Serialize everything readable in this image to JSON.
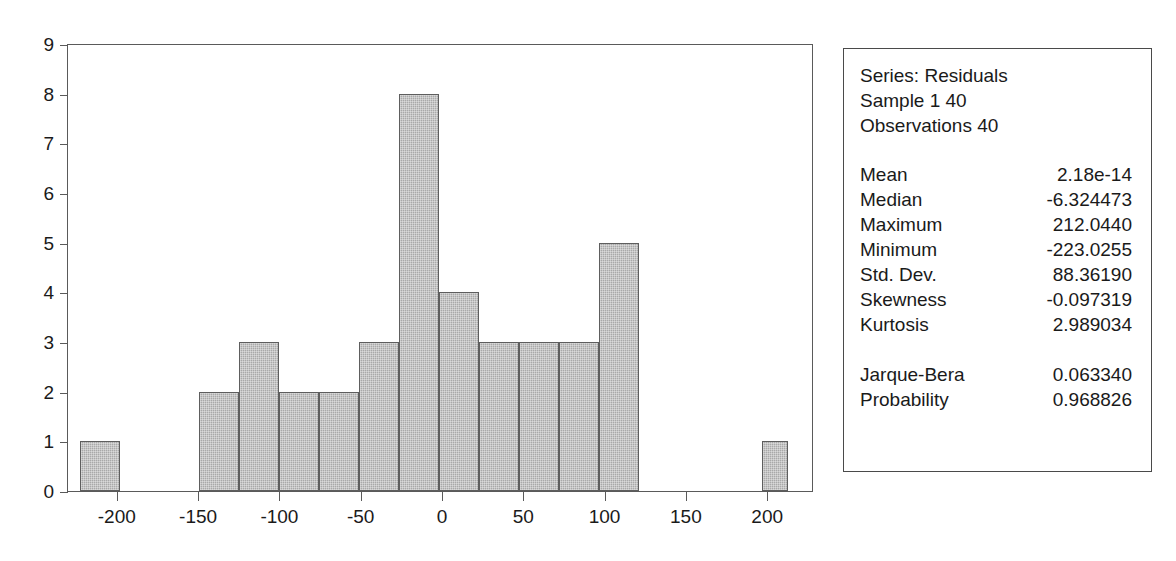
{
  "chart_data": {
    "type": "bar",
    "title": "",
    "subtitle": "",
    "xlabel": "",
    "ylabel": "",
    "grid": false,
    "legend_position": "none",
    "xlim": [
      -235,
      235
    ],
    "ylim": [
      0,
      9
    ],
    "x_ticks": [
      "-200",
      "-150",
      "-100",
      "-50",
      "0",
      "50",
      "100",
      "150",
      "200"
    ],
    "x_tick_values": [
      -200,
      -150,
      -100,
      -50,
      0,
      50,
      100,
      150,
      200
    ],
    "y_ticks": [
      "0",
      "1",
      "2",
      "3",
      "4",
      "5",
      "6",
      "7",
      "8",
      "9"
    ],
    "y_tick_values": [
      0,
      1,
      2,
      3,
      4,
      5,
      6,
      7,
      8,
      9
    ],
    "bin_width": 24.6,
    "bins": [
      {
        "left": -223.0,
        "right": -198.4,
        "count": 1
      },
      {
        "left": -149.8,
        "right": -125.2,
        "count": 2
      },
      {
        "left": -125.2,
        "right": -100.6,
        "count": 3
      },
      {
        "left": -100.6,
        "right": -76.0,
        "count": 2
      },
      {
        "left": -76.0,
        "right": -51.4,
        "count": 2
      },
      {
        "left": -51.4,
        "right": -26.8,
        "count": 3
      },
      {
        "left": -26.8,
        "right": -2.2,
        "count": 8
      },
      {
        "left": -2.2,
        "right": 22.4,
        "count": 4
      },
      {
        "left": 22.4,
        "right": 47.0,
        "count": 3
      },
      {
        "left": 47.0,
        "right": 71.6,
        "count": 3
      },
      {
        "left": 71.6,
        "right": 96.2,
        "count": 3
      },
      {
        "left": 96.2,
        "right": 120.8,
        "count": 5
      },
      {
        "left": 196.0,
        "right": 212.0,
        "count": 1
      }
    ],
    "categories": [
      "-223 to -198",
      "-150 to -125",
      "-125 to -101",
      "-101 to -76",
      "-76 to -51",
      "-51 to -27",
      "-27 to -2",
      "-2 to 22",
      "22 to 47",
      "47 to 72",
      "72 to 96",
      "96 to 121",
      "196 to 212"
    ],
    "values": [
      1,
      2,
      3,
      2,
      2,
      3,
      8,
      4,
      3,
      3,
      3,
      5,
      1
    ],
    "bar_fill_color": "#a9a9a9",
    "bar_border_color": "#5e5e5e",
    "axis_color": "#5a5a5a"
  },
  "stats_box": {
    "header": [
      "Series: Residuals",
      "Sample 1 40",
      "Observations 40"
    ],
    "rows": [
      {
        "label": "Mean",
        "value": "2.18e-14"
      },
      {
        "label": "Median",
        "value": "-6.324473"
      },
      {
        "label": "Maximum",
        "value": "212.0440"
      },
      {
        "label": "Minimum",
        "value": "-223.0255"
      },
      {
        "label": "Std. Dev.",
        "value": "88.36190"
      },
      {
        "label": "Skewness",
        "value": "-0.097319"
      },
      {
        "label": "Kurtosis",
        "value": "2.989034"
      }
    ],
    "test_rows": [
      {
        "label": "Jarque-Bera",
        "value": "0.063340"
      },
      {
        "label": "Probability",
        "value": "0.968826"
      }
    ]
  }
}
